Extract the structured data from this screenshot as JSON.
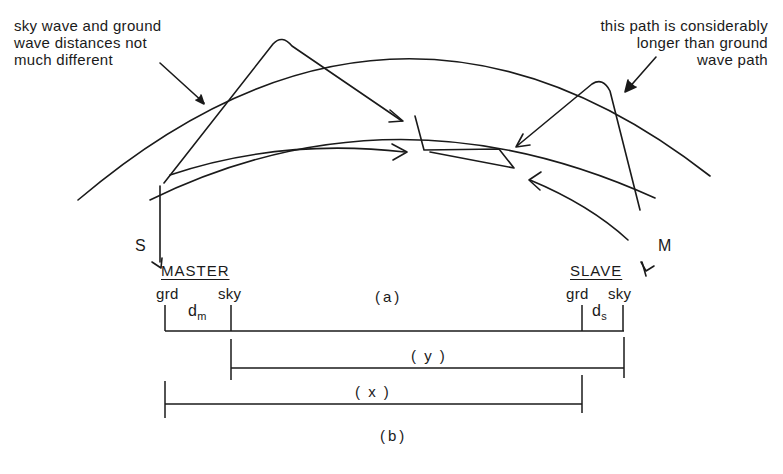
{
  "figure": {
    "panel_a": {
      "caption": "(a)",
      "annotation_left": {
        "lines": [
          "sky wave and ground",
          "wave distances not",
          "much different"
        ]
      },
      "annotation_right": {
        "lines": [
          "this path is considerably",
          "longer than ground",
          "wave path"
        ]
      },
      "station_slave_label": "S",
      "station_master_label": "M",
      "elements": [
        "earth-surface-arc",
        "ionosphere-arc",
        "sky-wave-from-S",
        "ground-wave-from-S",
        "sky-wave-from-M",
        "ground-wave-from-M",
        "aircraft-receiver"
      ]
    },
    "panel_b": {
      "caption": "(b)",
      "master_heading": "MASTER",
      "slave_heading": "SLAVE",
      "master_grd": "grd",
      "master_sky": "sky",
      "slave_grd": "grd",
      "slave_sky": "sky",
      "dm_base": "d",
      "dm_sub": "m",
      "ds_base": "d",
      "ds_sub": "s",
      "interval_y": "( y )",
      "interval_x": "( x )"
    },
    "colors": {
      "ink": "#1a1a1a",
      "background": "#ffffff"
    }
  }
}
